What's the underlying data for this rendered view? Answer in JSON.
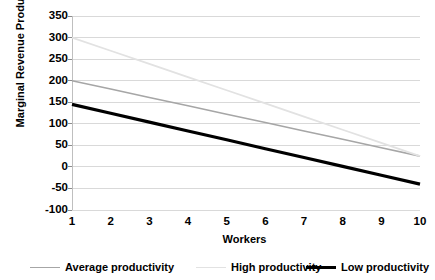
{
  "chart_data": {
    "type": "line",
    "title": "",
    "xlabel": "Workers",
    "ylabel": "Marginal Revenue Product",
    "x": [
      1,
      2,
      3,
      4,
      5,
      6,
      7,
      8,
      9,
      10
    ],
    "xtick_labels": [
      "1",
      "2",
      "3",
      "4",
      "5",
      "6",
      "7",
      "8",
      "9",
      "10"
    ],
    "ytick_labels": [
      "350",
      "300",
      "250",
      "200",
      "150",
      "100",
      "50",
      "0",
      "-50",
      "-100"
    ],
    "ylim": [
      -100,
      350
    ],
    "ytick_step": 50,
    "xlim": [
      1,
      10
    ],
    "grid": "horizontal",
    "legend_position": "bottom",
    "series": [
      {
        "name": "Average productivity",
        "color": "#a6a6a6",
        "width": 1.6,
        "values": [
          200,
          180.6,
          161.1,
          141.7,
          122.2,
          102.8,
          83.3,
          63.9,
          44.4,
          25
        ]
      },
      {
        "name": "High productivity",
        "color": "#e2e2e2",
        "width": 1.8,
        "values": [
          300,
          269.4,
          238.9,
          208.3,
          177.8,
          147.2,
          116.7,
          86.1,
          55.6,
          25
        ]
      },
      {
        "name": "Low productivity",
        "color": "#000000",
        "width": 3.2,
        "values": [
          145,
          124.4,
          103.9,
          83.3,
          62.8,
          42.2,
          21.7,
          1.1,
          -19.4,
          -40
        ]
      }
    ]
  },
  "legend": {
    "items": [
      {
        "label": "Average productivity",
        "color": "#a6a6a6",
        "thickness": "1.6px"
      },
      {
        "label": "High productivity",
        "color": "#e2e2e2",
        "thickness": "1.8px"
      },
      {
        "label": "Low productivity",
        "color": "#000000",
        "thickness": "3.2px"
      }
    ]
  }
}
